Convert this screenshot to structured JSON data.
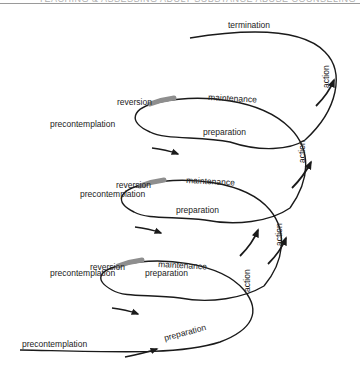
{
  "header": {
    "running_head": "TEACHING & ASSESSING ADULT SUBSTANCE ABUSE COUNSELING"
  },
  "diagram": {
    "colors": {
      "line": "#1a1a1a",
      "reversion_band": "#8e8e8e",
      "label": "#222222"
    },
    "top": {
      "termination": "termination",
      "action": "action"
    },
    "loops": [
      {
        "reversion": "reversion",
        "maintenance": "maintenance",
        "precontemplation": "precontemplation",
        "preparation": "preparation",
        "action": "action"
      },
      {
        "reversion": "reversion",
        "maintenance": "maintenance",
        "precontemplation": "precontemplation",
        "preparation": "preparation",
        "action": "action"
      },
      {
        "reversion": "reversion",
        "maintenance": "maintenance",
        "precontemplation": "precontemplation",
        "preparation": "preparation",
        "action": "action"
      }
    ],
    "bottom": {
      "precontemplation": "precontemplation",
      "preparation": "preparation"
    }
  }
}
